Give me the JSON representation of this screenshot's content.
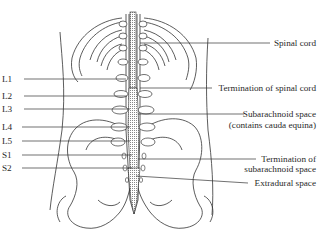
{
  "diagram": {
    "title": "",
    "colors": {
      "line": "#333333",
      "background": "#ffffff",
      "shading": "#999999"
    },
    "left_labels": [
      {
        "id": "L1",
        "text": "L1"
      },
      {
        "id": "L2",
        "text": "L2"
      },
      {
        "id": "L3",
        "text": "L3"
      },
      {
        "id": "L4",
        "text": "L4"
      },
      {
        "id": "L5",
        "text": "L5"
      },
      {
        "id": "S1",
        "text": "S1"
      },
      {
        "id": "S2",
        "text": "S2"
      }
    ],
    "right_labels": [
      {
        "id": "spinal_cord",
        "lines": [
          "Spinal cord"
        ]
      },
      {
        "id": "termination_spinal_cord",
        "lines": [
          "Termination of spinal cord"
        ]
      },
      {
        "id": "subarachnoid_space",
        "lines": [
          "Subarachnoid space",
          "(contains cauda equina)"
        ]
      },
      {
        "id": "termination_subarachnoid",
        "lines": [
          "Termination of",
          "subarachnoid space"
        ]
      },
      {
        "id": "extradural_space",
        "lines": [
          "Extradural space"
        ]
      }
    ]
  }
}
